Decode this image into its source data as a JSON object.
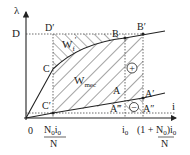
{
  "axes": {
    "y_label": "λ",
    "x_label": "i",
    "origin_label": "0",
    "y_tick_label": "D"
  },
  "points": {
    "D_prime": "D′",
    "C": "C",
    "C_prime": "C′",
    "B": "B",
    "B_prime": "B′",
    "A": "A",
    "A_prime": "A′",
    "A_double_prime": "A″",
    "A_triple_prime": "A‴"
  },
  "regions": {
    "w_field": "W",
    "w_field_sub": "f",
    "w_field_prime": "′",
    "w_mec": "W",
    "w_mec_sub": "mec"
  },
  "signs": {
    "plus": "+",
    "minus": "−"
  },
  "x_ticks": {
    "left_num": "N",
    "left_num_sub": "0",
    "left_num_i": "i",
    "left_num_i_sub": "0",
    "left_den": "N",
    "i0": "i",
    "i0_sub": "0",
    "right_prefix": "(1 + ",
    "right_num": "N",
    "right_num_sub": "0",
    "right_suffix": ")i",
    "right_suffix_sub": "0",
    "right_den": "N"
  },
  "colors": {
    "line": "#222222",
    "background": "#ffffff"
  }
}
